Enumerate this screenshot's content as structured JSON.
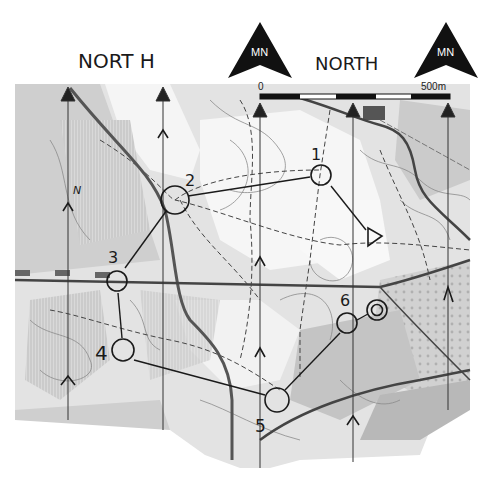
{
  "map": {
    "type": "orienteering-map",
    "background_color": "#ffffff",
    "terrain_colors": {
      "open": "#f4f4f4",
      "forest_light": "#d6d6d6",
      "forest_dark": "#bcbcbc",
      "ink": "#1a1a1a",
      "road": "#555555"
    }
  },
  "annotations": {
    "north_label_left": "NORT H",
    "north_label_right": "NORTH",
    "mn_left": "MN",
    "mn_right": "MN",
    "n_letter": "N"
  },
  "scale_bar": {
    "start_label": "0",
    "end_label": "500m"
  },
  "controls": [
    {
      "number": "1",
      "x": 321,
      "y": 175
    },
    {
      "number": "2",
      "x": 175,
      "y": 200
    },
    {
      "number": "3",
      "x": 117,
      "y": 281
    },
    {
      "number": "4",
      "x": 123,
      "y": 350
    },
    {
      "number": "5",
      "x": 277,
      "y": 400
    },
    {
      "number": "6",
      "x": 347,
      "y": 323
    }
  ],
  "start": {
    "symbol": "triangle",
    "x": 373,
    "y": 237
  },
  "finish": {
    "symbol": "double-circle",
    "x": 377,
    "y": 310
  }
}
